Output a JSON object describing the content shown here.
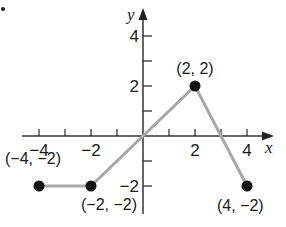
{
  "chart_data": {
    "type": "line",
    "title": "",
    "xlabel": "x",
    "ylabel": "y",
    "xlim": [
      -4.5,
      5
    ],
    "ylim": [
      -3,
      5
    ],
    "grid": false,
    "x_ticks": [
      -4,
      -3,
      -2,
      -1,
      1,
      2,
      3,
      4
    ],
    "x_tick_labels": [
      "−4",
      "−2",
      "2",
      "4"
    ],
    "x_tick_label_values": [
      -4,
      -2,
      2,
      4
    ],
    "y_ticks": [
      -2,
      -1,
      1,
      2,
      3,
      4
    ],
    "y_tick_labels": [
      "4",
      "2",
      "−2"
    ],
    "y_tick_label_values": [
      4,
      2,
      -2
    ],
    "series": [
      {
        "name": "piecewise-linear",
        "x": [
          -4,
          -2,
          2,
          4
        ],
        "y": [
          -2,
          -2,
          2,
          -2
        ],
        "color": "#a8a8a8",
        "markers": "filled-circle"
      }
    ],
    "annotations": [
      {
        "text": "(−4, −2)",
        "x": -4,
        "y": -2
      },
      {
        "text": "(−2, −2)",
        "x": -2,
        "y": -2
      },
      {
        "text": "(2, 2)",
        "x": 2,
        "y": 2
      },
      {
        "text": "(4, −2)",
        "x": 4,
        "y": -2
      }
    ],
    "colors": {
      "line": "#a8a8a8",
      "points": "#111111",
      "axes": "#333333"
    }
  }
}
